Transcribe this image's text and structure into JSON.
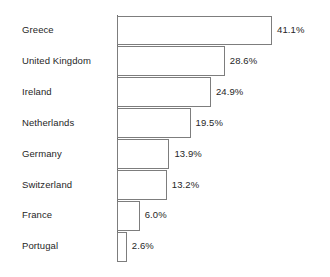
{
  "chart_data": {
    "type": "bar",
    "orientation": "horizontal",
    "title": "",
    "subtitle": "",
    "xlabel": "",
    "ylabel": "",
    "grid": false,
    "legend": null,
    "axis_baseline": 0,
    "xlim": [
      0,
      41.1
    ],
    "value_suffix": "%",
    "categories": [
      "Greece",
      "United Kingdom",
      "Ireland",
      "Netherlands",
      "Germany",
      "Switzerland",
      "France",
      "Portugal"
    ],
    "values": [
      41.1,
      28.6,
      24.9,
      19.5,
      13.9,
      13.2,
      6.0,
      2.6
    ],
    "data_labels": [
      "41.1%",
      "28.6%",
      "24.9%",
      "19.5%",
      "13.9%",
      "13.2%",
      "6.0%",
      "2.6%"
    ]
  },
  "style": {
    "bar_fill": "#ffffff",
    "bar_border": "#7d7d7d",
    "axis_color": "#6e6e6e",
    "text_color": "#262626",
    "background": "#ffffff"
  }
}
